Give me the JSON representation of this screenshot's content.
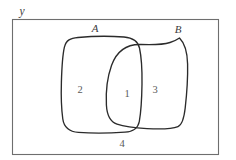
{
  "figure": {
    "type": "venn-diagram",
    "title": "",
    "universe_label": "у",
    "background_color": "#ffffff",
    "line_color": "#2b2b2b",
    "frame_color": "#6e6e6e",
    "text_color": "#4a4a4a"
  },
  "universe": {
    "name": "universal-set",
    "label": "у",
    "label_x": 22,
    "label_y": 14,
    "rect": {
      "x": 12,
      "y": 19,
      "width": 207,
      "height": 136
    }
  },
  "sets": [
    {
      "id": "A",
      "label": "A",
      "label_x": 95,
      "label_y": 32,
      "shape": "rounded-blob"
    },
    {
      "id": "B",
      "label": "B",
      "label_x": 178,
      "label_y": 33,
      "shape": "rounded-blob"
    }
  ],
  "regions": [
    {
      "id": "region-1",
      "label": "1",
      "meaning": "A ∩ B",
      "x": 127,
      "y": 93
    },
    {
      "id": "region-2",
      "label": "2",
      "meaning": "A only",
      "x": 80,
      "y": 89
    },
    {
      "id": "region-3",
      "label": "3",
      "meaning": "B only",
      "x": 155,
      "y": 89
    },
    {
      "id": "region-4",
      "label": "4",
      "meaning": "outside A and B",
      "x": 122,
      "y": 146
    }
  ],
  "intersection_points": [
    {
      "name": "upper-crossing",
      "x": 137,
      "y": 53
    },
    {
      "name": "lower-crossing",
      "x": 122,
      "y": 128
    }
  ]
}
